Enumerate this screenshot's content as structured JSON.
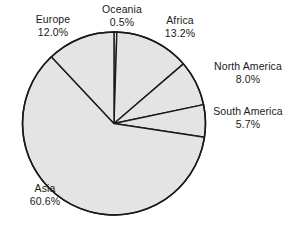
{
  "chart_data": {
    "type": "pie",
    "title": "",
    "subtitle": "",
    "xlabel": "",
    "ylabel": "",
    "legend_position": "none",
    "grid": false,
    "start_angle_deg": 0,
    "direction": "clockwise",
    "categories": [
      "Oceania",
      "Africa",
      "North America",
      "South America",
      "Asia",
      "Europe"
    ],
    "values": [
      0.5,
      13.2,
      8.0,
      5.7,
      60.6,
      12.0
    ],
    "value_unit": "%",
    "slices": [
      {
        "label": "Oceania",
        "value": 0.5,
        "value_text": "0.5%",
        "color": "#e4e4e4"
      },
      {
        "label": "Africa",
        "value": 13.2,
        "value_text": "13.2%",
        "color": "#e4e4e4"
      },
      {
        "label": "North America",
        "value": 8.0,
        "value_text": "8.0%",
        "color": "#e4e4e4"
      },
      {
        "label": "South America",
        "value": 5.7,
        "value_text": "5.7%",
        "color": "#e4e4e4"
      },
      {
        "label": "Asia",
        "value": 60.6,
        "value_text": "60.6%",
        "color": "#e4e4e4"
      },
      {
        "label": "Europe",
        "value": 12.0,
        "value_text": "12.0%",
        "color": "#e4e4e4"
      }
    ]
  },
  "style": {
    "background": "#ffffff",
    "slice_fill": "#e4e4e4",
    "slice_stroke": "#1a1a1a",
    "label_color": "#1a1a1a"
  }
}
